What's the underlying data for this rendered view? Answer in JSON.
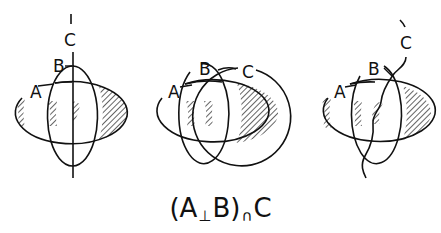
{
  "figure": {
    "caption": {
      "left_paren": "(A",
      "op1": "⊥",
      "mid": "B)",
      "op2": "∩",
      "right": "C",
      "full": "(A⊥B)∩C"
    },
    "panels": [
      {
        "id": "panel-1",
        "description": "A ellipse, B vertical ellipse, C as vertical straight line",
        "labels": {
          "a": "A",
          "b": "B",
          "c": "C"
        },
        "c_shape": "straight-line"
      },
      {
        "id": "panel-2",
        "description": "A ellipse, B vertical ellipse, C as circle",
        "labels": {
          "a": "A",
          "b": "B",
          "c": "C"
        },
        "c_shape": "circle"
      },
      {
        "id": "panel-3",
        "description": "A ellipse, B vertical ellipse, C as wavy curve",
        "labels": {
          "a": "A",
          "b": "B",
          "c": "C"
        },
        "c_shape": "wavy-curve"
      }
    ],
    "colors": {
      "stroke": "#111111",
      "hatch": "#111111",
      "background": "#ffffff"
    }
  }
}
